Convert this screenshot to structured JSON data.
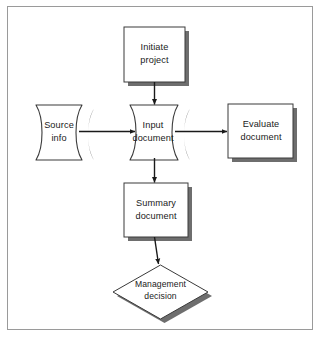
{
  "diagram": {
    "canvas": {
      "width": 325,
      "height": 344,
      "background": "#ffffff"
    },
    "frame": {
      "border_color": "#9a9a9a",
      "border_width": 1
    },
    "style": {
      "shape_stroke": "#3a3a3a",
      "shape_fill": "#ffffff",
      "shadow_color": "#6e6e6e",
      "arrow_color": "#1a1a1a",
      "text_color": "#1a1a1a"
    },
    "nodes": [
      {
        "id": "initiate",
        "type": "process",
        "label": "Initiate\nproject",
        "x": 124,
        "y": 27,
        "w": 61,
        "h": 55
      },
      {
        "id": "source",
        "type": "document",
        "label": "Source\ninfo",
        "x": 28,
        "y": 105,
        "w": 62,
        "h": 55
      },
      {
        "id": "input",
        "type": "document",
        "label": "Input\ndocument",
        "x": 122,
        "y": 105,
        "w": 64,
        "h": 55
      },
      {
        "id": "evaluate",
        "type": "process",
        "label": "Evaluate\ndocument",
        "x": 228,
        "y": 104,
        "w": 65,
        "h": 54
      },
      {
        "id": "summary",
        "type": "process",
        "label": "Summary\ndocument",
        "x": 124,
        "y": 183,
        "w": 64,
        "h": 54
      },
      {
        "id": "decision",
        "type": "decision",
        "label": "Management\ndecision",
        "x": 113,
        "y": 265,
        "w": 95,
        "h": 54
      }
    ],
    "edges": [
      {
        "id": "initiate-to-input",
        "from": "initiate",
        "to": "input",
        "direction": "down"
      },
      {
        "id": "source-to-input",
        "from": "source",
        "to": "input",
        "direction": "right"
      },
      {
        "id": "input-to-evaluate",
        "from": "input",
        "to": "evaluate",
        "direction": "right"
      },
      {
        "id": "input-to-summary",
        "from": "input",
        "to": "summary",
        "direction": "down"
      },
      {
        "id": "summary-to-decision",
        "from": "summary",
        "to": "decision",
        "direction": "down"
      }
    ]
  }
}
